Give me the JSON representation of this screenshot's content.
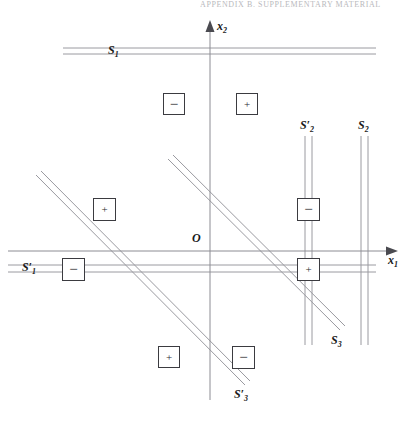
{
  "header": {
    "running_head": "APPENDIX B. SUPPLEMENTARY MATERIAL"
  },
  "figure": {
    "origin_label": "O",
    "axes": [
      {
        "id": "x1",
        "label": "x",
        "subscript": "1",
        "orientation": "horizontal",
        "direction": "right"
      },
      {
        "id": "x2",
        "label": "x",
        "subscript": "2",
        "orientation": "vertical",
        "direction": "up"
      }
    ],
    "lines": [
      {
        "id": "S1",
        "label": "S",
        "subscript": "1",
        "prime": false,
        "style": "double",
        "orientation": "horizontal",
        "label_pos": "left"
      },
      {
        "id": "S1p",
        "label": "S",
        "subscript": "1",
        "prime": true,
        "style": "double",
        "orientation": "horizontal",
        "label_pos": "left"
      },
      {
        "id": "S2",
        "label": "S",
        "subscript": "2",
        "prime": false,
        "style": "double",
        "orientation": "vertical",
        "label_pos": "top"
      },
      {
        "id": "S2p",
        "label": "S",
        "subscript": "2",
        "prime": true,
        "style": "double",
        "orientation": "vertical",
        "label_pos": "top"
      },
      {
        "id": "S3",
        "label": "S",
        "subscript": "3",
        "prime": false,
        "style": "double",
        "orientation": "diagonal",
        "label_pos": "bottom-right"
      },
      {
        "id": "S3p",
        "label": "S",
        "subscript": "3",
        "prime": true,
        "style": "double",
        "orientation": "diagonal",
        "label_pos": "bottom-right"
      }
    ],
    "signs": [
      {
        "id": "sign-1",
        "symbol": "−",
        "kind": "minus"
      },
      {
        "id": "sign-2",
        "symbol": "+",
        "kind": "plus"
      },
      {
        "id": "sign-3",
        "symbol": "+",
        "kind": "plus"
      },
      {
        "id": "sign-4",
        "symbol": "−",
        "kind": "minus"
      },
      {
        "id": "sign-5",
        "symbol": "−",
        "kind": "minus"
      },
      {
        "id": "sign-6",
        "symbol": "+",
        "kind": "plus"
      },
      {
        "id": "sign-7",
        "symbol": "+",
        "kind": "plus"
      },
      {
        "id": "sign-8",
        "symbol": "−",
        "kind": "minus"
      }
    ],
    "colors": {
      "axis": "#8c8c93",
      "line": "#9a9aa0",
      "box_border": "#3b3b40",
      "text": "#1a1a1a",
      "header_text": "#b9b9bd",
      "background": "#ffffff"
    }
  }
}
